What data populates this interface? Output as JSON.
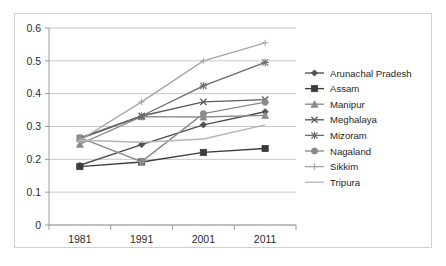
{
  "chart_data": {
    "type": "line",
    "title": "",
    "xlabel": "",
    "ylabel": "",
    "categories": [
      "1981",
      "1991",
      "2001",
      "2011"
    ],
    "x_tick_labels": [
      "1981",
      "1991",
      "2001",
      "2011"
    ],
    "y_tick_labels": [
      "0",
      "0.1",
      "0.2",
      "0.3",
      "0.4",
      "0.5",
      "0.6"
    ],
    "y_tick_values": [
      0,
      0.1,
      0.2,
      0.3,
      0.4,
      0.5,
      0.6
    ],
    "ylim": [
      0,
      0.6
    ],
    "grid": "horizontal",
    "legend_position": "right",
    "series": [
      {
        "name": "Arunachal Pradesh",
        "marker": "diamond",
        "color": "#4f4f4f",
        "values": [
          0.182,
          0.245,
          0.305,
          0.345
        ]
      },
      {
        "name": "Assam",
        "marker": "square",
        "color": "#3c3c3c",
        "values": [
          0.178,
          0.192,
          0.221,
          0.233
        ]
      },
      {
        "name": "Manipur",
        "marker": "triangle",
        "color": "#8c8c8c",
        "values": [
          0.246,
          0.33,
          0.329,
          0.334
        ]
      },
      {
        "name": "Meghalaya",
        "marker": "x-cross",
        "color": "#5a5a5a",
        "values": [
          0.265,
          0.332,
          0.375,
          0.382
        ]
      },
      {
        "name": "Mizoram",
        "marker": "asterisk",
        "color": "#6b6b6b",
        "values": [
          0.262,
          0.332,
          0.424,
          0.495
        ]
      },
      {
        "name": "Nagaland",
        "marker": "circle",
        "color": "#8a8a8a",
        "values": [
          0.266,
          0.193,
          0.339,
          0.374
        ]
      },
      {
        "name": "Sikkim",
        "marker": "plus",
        "color": "#a6a6a6",
        "values": [
          0.258,
          0.375,
          0.5,
          0.555
        ]
      },
      {
        "name": "Tripura",
        "marker": "none",
        "color": "#b5b5b5",
        "values": [
          0.258,
          0.252,
          0.262,
          0.305
        ]
      }
    ]
  },
  "axis_colors": {
    "gridline": "#c8c8c8",
    "axis": "#9a9a9a",
    "text": "#2b2b2b",
    "frame": "#d0d0d0"
  }
}
